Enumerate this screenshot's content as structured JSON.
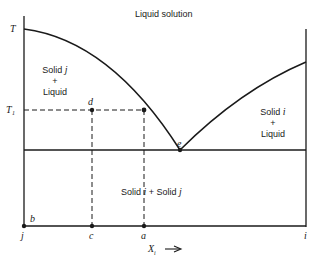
{
  "diagram": {
    "type": "binary eutectic phase diagram",
    "region_labels": {
      "liquid": "Liquid solution",
      "solid_j_liquid": {
        "line1": "Solid j",
        "line2": "+",
        "line3": "Liquid"
      },
      "solid_i_liquid": {
        "line1": "Solid i",
        "line2": "+",
        "line3": "Liquid"
      },
      "solid_solid": "Solid i + Solid j"
    },
    "axis_labels": {
      "T": "T",
      "T1": "T₁",
      "x_axis": "Xᵢ →",
      "j": "j",
      "i": "i"
    },
    "points": {
      "b": "b",
      "c": "c",
      "a": "a",
      "d": "d",
      "e": "e"
    },
    "colors": {
      "line": "#1a1a1a",
      "background": "#ffffff"
    }
  }
}
